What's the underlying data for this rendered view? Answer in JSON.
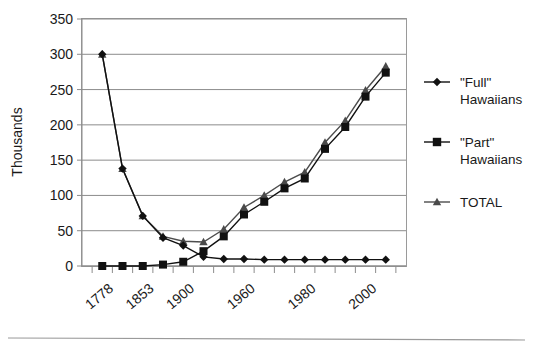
{
  "chart_data": {
    "type": "line",
    "title": "",
    "xlabel": "",
    "ylabel": "Thousands",
    "ylim": [
      0,
      350
    ],
    "yticks": [
      0,
      50,
      100,
      150,
      200,
      250,
      300,
      350
    ],
    "ytick_labels": [
      "0",
      "50",
      "100",
      "150",
      "200",
      "250",
      "300",
      "350"
    ],
    "grid": true,
    "legend_position": "right",
    "categories": [
      "1778",
      "1823",
      "1853",
      "1878",
      "1900",
      "1910",
      "1920",
      "1930",
      "1950",
      "1960",
      "1970",
      "1980",
      "1990",
      "2000",
      "2005"
    ],
    "xtick_labels": [
      "1778",
      "1853",
      "1900",
      "1960",
      "1980",
      "2000"
    ],
    "xtick_label_indices": [
      0,
      2,
      4,
      7,
      10,
      13
    ],
    "series": [
      {
        "name": "\"Full\" Hawaiians",
        "marker": "diamond",
        "color": "#111111",
        "values": [
          300,
          138,
          71,
          40,
          29,
          13,
          10,
          10,
          9,
          9,
          9,
          9,
          9,
          9,
          9
        ]
      },
      {
        "name": "\"Part\" Hawaiians",
        "marker": "square",
        "color": "#111111",
        "values": [
          0,
          0,
          0,
          2,
          6,
          21,
          42,
          73,
          91,
          110,
          124,
          166,
          197,
          240,
          274
        ]
      },
      {
        "name": "TOTAL",
        "marker": "triangle",
        "color": "#4a4a4a",
        "values": [
          300,
          138,
          71,
          42,
          35,
          34,
          52,
          83,
          100,
          119,
          133,
          175,
          206,
          249,
          283
        ]
      }
    ]
  },
  "legend": {
    "items": [
      {
        "label_line1": "\"Full\"",
        "label_line2": "Hawaiians",
        "marker": "diamond"
      },
      {
        "label_line1": "\"Part\"",
        "label_line2": "Hawaiians",
        "marker": "square"
      },
      {
        "label_line1": "TOTAL",
        "label_line2": "",
        "marker": "triangle"
      }
    ]
  },
  "axes": {
    "y_axis_title": "Thousands"
  }
}
